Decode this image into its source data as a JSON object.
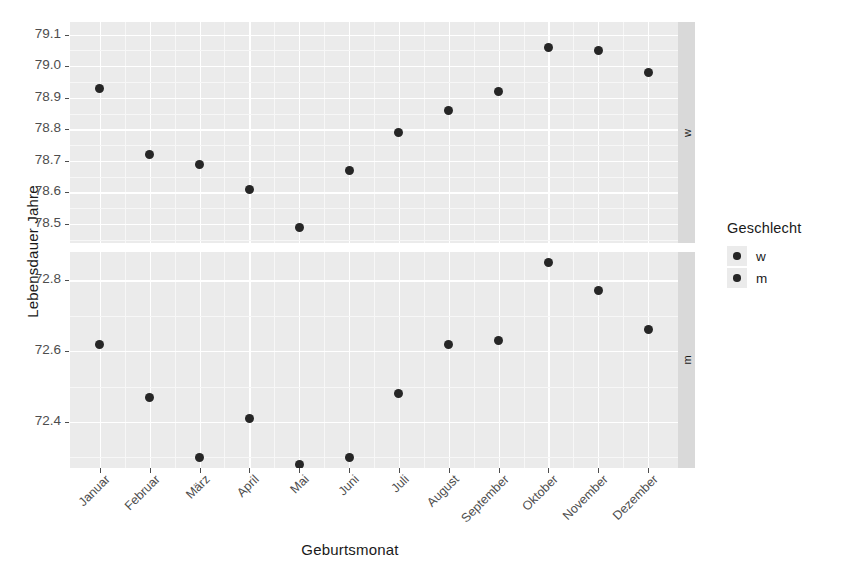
{
  "chart_data": {
    "type": "scatter",
    "title": "",
    "xlabel": "Geburtsmonat",
    "ylabel": "Lebensdauer Jahre",
    "legend_title": "Geschlecht",
    "legend_position": "right",
    "grid": true,
    "categories": [
      "Januar",
      "Februar",
      "März",
      "April",
      "Mai",
      "Juni",
      "Juli",
      "August",
      "September",
      "Oktober",
      "November",
      "Dezember"
    ],
    "facets": [
      {
        "label": "w",
        "ylim": [
          78.44,
          79.14
        ],
        "yticks": [
          "79.1",
          "79.0",
          "78.9",
          "78.8",
          "78.7",
          "78.6",
          "78.5"
        ],
        "ytickvalues": [
          79.1,
          79.0,
          78.9,
          78.8,
          78.7,
          78.6,
          78.5
        ],
        "values": [
          78.93,
          78.72,
          78.69,
          78.61,
          78.49,
          78.67,
          78.79,
          78.86,
          78.92,
          79.06,
          79.05,
          78.98
        ]
      },
      {
        "label": "m",
        "ylim": [
          72.27,
          72.88
        ],
        "yticks": [
          "72.8",
          "72.6",
          "72.4"
        ],
        "ytickvalues": [
          72.8,
          72.6,
          72.4
        ],
        "values": [
          72.62,
          72.47,
          72.3,
          72.41,
          72.28,
          72.3,
          72.48,
          72.62,
          72.63,
          72.85,
          72.77,
          72.66
        ]
      }
    ],
    "series": [
      {
        "name": "w",
        "values": [
          78.93,
          78.72,
          78.69,
          78.61,
          78.49,
          78.67,
          78.79,
          78.86,
          78.92,
          79.06,
          79.05,
          78.98
        ]
      },
      {
        "name": "m",
        "values": [
          72.62,
          72.47,
          72.3,
          72.41,
          72.28,
          72.3,
          72.48,
          72.62,
          72.63,
          72.85,
          72.77,
          72.66
        ]
      }
    ],
    "legend_items": [
      {
        "label": "w",
        "color": "#262626"
      },
      {
        "label": "m",
        "color": "#262626"
      }
    ],
    "colors": {
      "point": "#262626",
      "panel_background": "#EBEBEB",
      "gridline": "#FFFFFF",
      "strip_background": "#D9D9D9",
      "text": "#1a1a1a",
      "axis_text": "#4d4d4d"
    }
  }
}
